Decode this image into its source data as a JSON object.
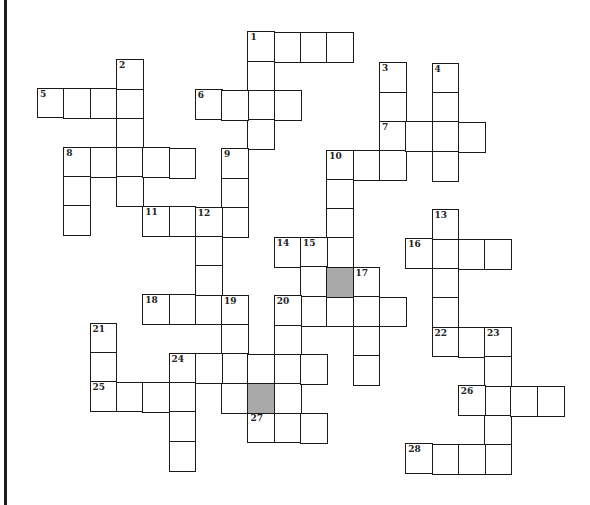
{
  "puzzle": {
    "grid_geometry": {
      "origin_x": 37,
      "origin_y": 29,
      "cell_w": 26.3,
      "cell_h": 29.3,
      "skew_y_per_col": 0.3
    },
    "colors": {
      "border": "#1a1a1a",
      "cell_bg": "#ffffff",
      "shaded": "#a9a9a9",
      "left_rule": "#1e1e1e"
    },
    "shaded_cells": [
      [
        8,
        11
      ],
      [
        12,
        8
      ]
    ],
    "entries": [
      {
        "number": "1",
        "row": 0,
        "col": 8,
        "across": 4,
        "down": 4
      },
      {
        "number": "2",
        "row": 1,
        "col": 3,
        "down": 5
      },
      {
        "number": "3",
        "row": 1,
        "col": 13,
        "down": 4
      },
      {
        "number": "4",
        "row": 1,
        "col": 15,
        "down": 4
      },
      {
        "number": "5",
        "row": 2,
        "col": 0,
        "across": 4
      },
      {
        "number": "6",
        "row": 2,
        "col": 6,
        "across": 4
      },
      {
        "number": "7",
        "row": 3,
        "col": 13,
        "across": 4
      },
      {
        "number": "8",
        "row": 4,
        "col": 1,
        "across": 5,
        "down": 3
      },
      {
        "number": "9",
        "row": 4,
        "col": 7,
        "down": 3
      },
      {
        "number": "10",
        "row": 4,
        "col": 11,
        "across": 3,
        "down": 4
      },
      {
        "number": "11",
        "row": 6,
        "col": 4,
        "across": 4
      },
      {
        "number": "12",
        "row": 6,
        "col": 6,
        "down": 4
      },
      {
        "number": "13",
        "row": 6,
        "col": 15,
        "down": 5
      },
      {
        "number": "14",
        "row": 7,
        "col": 9,
        "across": 3
      },
      {
        "number": "15",
        "row": 7,
        "col": 10,
        "down": 3
      },
      {
        "number": "16",
        "row": 7,
        "col": 14,
        "across": 4
      },
      {
        "number": "17",
        "row": 8,
        "col": 12,
        "down": 4
      },
      {
        "number": "18",
        "row": 9,
        "col": 4,
        "across": 4
      },
      {
        "number": "19",
        "row": 9,
        "col": 7,
        "down": 4
      },
      {
        "number": "20",
        "row": 9,
        "col": 9,
        "across": 5,
        "down": 5
      },
      {
        "number": "21",
        "row": 10,
        "col": 2,
        "down": 3
      },
      {
        "number": "22",
        "row": 10,
        "col": 15,
        "across": 3
      },
      {
        "number": "23",
        "row": 10,
        "col": 17,
        "down": 5
      },
      {
        "number": "24",
        "row": 11,
        "col": 5,
        "across": 6,
        "down": 4
      },
      {
        "number": "25",
        "row": 12,
        "col": 2,
        "across": 4
      },
      {
        "number": "26",
        "row": 12,
        "col": 16,
        "across": 4
      },
      {
        "number": "27",
        "row": 13,
        "col": 8,
        "across": 3
      },
      {
        "number": "28",
        "row": 14,
        "col": 14,
        "across": 4
      }
    ]
  }
}
